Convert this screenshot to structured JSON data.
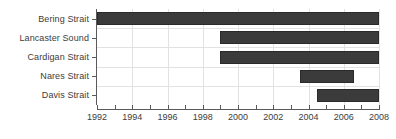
{
  "chart_data": {
    "type": "bar",
    "orientation": "horizontal",
    "subtype": "gantt-range",
    "title": "",
    "subtitle": "",
    "xlabel": "",
    "ylabel": "",
    "xlim": [
      1992,
      2008
    ],
    "ylim": null,
    "grid": {
      "vertical": true,
      "horizontal": true,
      "color": "#e2e2e2"
    },
    "legend": {
      "visible": false,
      "position": null,
      "entries": []
    },
    "bar_color": "#3b3b3b",
    "bar_edge_color": "#2a2a2a",
    "axis_color": "#5a5a5a",
    "text_color": "#3c3c3c",
    "background": "#ffffff",
    "categories": [
      "Bering Strait",
      "Lancaster Sound",
      "Cardigan Strait",
      "Nares Strait",
      "Davis Strait"
    ],
    "bars": [
      {
        "category": "Bering Strait",
        "start": 1992.0,
        "end": 2008.0,
        "duration": 16.0
      },
      {
        "category": "Lancaster Sound",
        "start": 1999.0,
        "end": 2008.0,
        "duration": 9.0
      },
      {
        "category": "Cardigan Strait",
        "start": 1999.0,
        "end": 2008.0,
        "duration": 9.0
      },
      {
        "category": "Nares Strait",
        "start": 2003.5,
        "end": 2006.6,
        "duration": 3.1
      },
      {
        "category": "Davis Strait",
        "start": 2004.5,
        "end": 2008.0,
        "duration": 3.5
      }
    ],
    "x_ticks_minor": [
      1992,
      1993,
      1994,
      1995,
      1996,
      1997,
      1998,
      1999,
      2000,
      2001,
      2002,
      2003,
      2004,
      2005,
      2006,
      2007,
      2008
    ],
    "x_ticks_labeled": [
      {
        "value": 1992,
        "label": "1992"
      },
      {
        "value": 1994,
        "label": "1994"
      },
      {
        "value": 1996,
        "label": "1996"
      },
      {
        "value": 1998,
        "label": "1998"
      },
      {
        "value": 2000,
        "label": "2000"
      },
      {
        "value": 2002,
        "label": "2002"
      },
      {
        "value": 2004,
        "label": "2004"
      },
      {
        "value": 2006,
        "label": "2006"
      },
      {
        "value": 2008,
        "label": "2008"
      }
    ],
    "x_gridlines": [
      1994,
      1996,
      1998,
      2000,
      2002,
      2004,
      2006,
      2008
    ]
  }
}
